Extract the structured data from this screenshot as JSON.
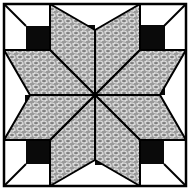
{
  "image": {
    "subject": "Eight-pointed star quilt block",
    "width": 190,
    "height": 191
  },
  "colors": {
    "background": "#ffffff",
    "outline": "#000000",
    "shadow": "#0a0a0a",
    "print_base": "#9a9a9a",
    "print_highlight": "#e6e6e6"
  },
  "geometry": {
    "frame": [
      4,
      4,
      186,
      186
    ],
    "center": [
      95,
      95
    ],
    "grid_lines": [
      50,
      140
    ]
  }
}
